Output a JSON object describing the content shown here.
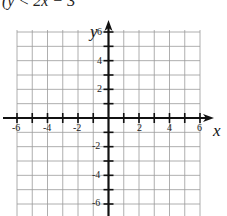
{
  "header": {
    "text": "(y < 2x − 3"
  },
  "graph": {
    "x_axis_label": "x",
    "y_axis_label": "y",
    "x_range": [
      -6,
      6
    ],
    "y_range": [
      -6,
      6
    ],
    "grid_step": 1,
    "x_tick_labels": [
      "-6",
      "-4",
      "-2",
      "2",
      "4",
      "6"
    ],
    "y_tick_labels": [
      "6",
      "4",
      "2",
      "-2",
      "-4",
      "-6"
    ],
    "colors": {
      "axis": "#111111",
      "grid": "#9a9a9a"
    }
  },
  "chart_data": {
    "type": "table",
    "title": "",
    "xlabel": "x",
    "ylabel": "y",
    "xlim": [
      -6,
      6
    ],
    "ylim": [
      -6,
      6
    ],
    "grid": true,
    "x_ticks": [
      -6,
      -4,
      -2,
      2,
      4,
      6
    ],
    "y_ticks": [
      -6,
      -4,
      -2,
      2,
      4,
      6
    ],
    "annotations": [
      "(y < 2x − 3"
    ]
  }
}
